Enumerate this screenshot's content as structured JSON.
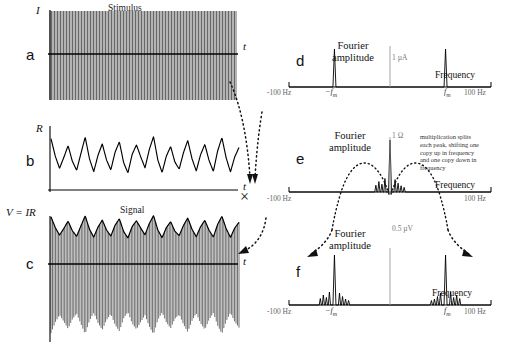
{
  "figure": {
    "caption_absent": true,
    "panels": [
      "a",
      "b",
      "c",
      "d",
      "e",
      "f"
    ]
  },
  "panel_a": {
    "label": "a",
    "title": "Stimulus",
    "y_axis": "I",
    "x_axis": "t",
    "description": "high-frequency carrier sinusoid, constant amplitude"
  },
  "panel_b": {
    "label": "b",
    "title": "",
    "y_axis": "R",
    "x_axis": "t",
    "description": "slowly varying irregular resistance waveform"
  },
  "panel_c": {
    "label": "c",
    "title": "Signal",
    "y_axis": "V = IR",
    "x_axis": "t",
    "description": "amplitude-modulated carrier, envelope follows R"
  },
  "panel_d": {
    "label": "d",
    "fourier_title_line1": "Fourier",
    "fourier_title_line2": "amplitude",
    "amplitude_tick": "1 µA",
    "x_label": "Frequency",
    "ticks": [
      "-100 Hz",
      "−f",
      "f",
      "100 Hz"
    ],
    "tick_left_full": "-100 Hz",
    "tick_right_full": "100 Hz",
    "tick_neg_fm": "−f",
    "tick_pos_fm": "f",
    "fm_sub": "m"
  },
  "panel_e": {
    "label": "e",
    "fourier_title_line1": "Fourier",
    "fourier_title_line2": "amplitude",
    "amplitude_tick": "1 Ω",
    "x_label": "Frequency",
    "tick_left_full": "-100 Hz",
    "tick_right_full": "100 Hz",
    "annotation": "multiplication splits each peak, shifting one copy up in frequency and one copy down in frequency"
  },
  "panel_f": {
    "label": "f",
    "fourier_title_line1": "Fourier",
    "fourier_title_line2": "amplitude",
    "amplitude_tick": "0.5 µV",
    "x_label": "Frequency",
    "tick_left_full": "-100 Hz",
    "tick_right_full": "100 Hz",
    "tick_neg_fm": "−f",
    "tick_pos_fm": "f",
    "fm_sub": "m"
  },
  "operator": {
    "multiply_symbol": "×"
  },
  "chart_data": {
    "type": "line",
    "panels": [
      {
        "id": "a",
        "type": "line",
        "title": "Stimulus",
        "xlabel": "t",
        "ylabel": "I",
        "description": "Sinusoidal carrier at f_m with constant amplitude",
        "carrier_cycles": 62,
        "amplitude": 1.0,
        "ylim": [
          -1.1,
          1.1
        ]
      },
      {
        "id": "b",
        "type": "line",
        "title": "",
        "xlabel": "t",
        "ylabel": "R",
        "description": "Low-frequency irregular modulation waveform",
        "ylim": [
          -1.0,
          1.0
        ],
        "samples": [
          0.82,
          0.15,
          -0.32,
          0.1,
          0.55,
          -0.05,
          -0.4,
          0.25,
          0.88,
          0.05,
          -0.45,
          0.18,
          0.62,
          0.0,
          -0.38,
          0.3,
          0.7,
          -0.1,
          -0.5,
          0.22,
          0.58,
          0.12,
          -0.3,
          0.4,
          0.9,
          0.0,
          -0.48,
          0.15,
          0.52,
          -0.08,
          -0.35,
          0.28,
          0.75,
          0.05,
          -0.42,
          0.2,
          0.6,
          -0.02,
          -0.44,
          0.35,
          0.86,
          0.08,
          -0.46,
          0.12,
          0.48
        ]
      },
      {
        "id": "c",
        "type": "line",
        "title": "Signal",
        "xlabel": "t",
        "ylabel": "V = IR",
        "description": "Product I x R: carrier amplitude-modulated by R envelope",
        "carrier_cycles": 62,
        "ylim": [
          -1.1,
          1.1
        ]
      },
      {
        "id": "d",
        "type": "line",
        "title": "Fourier amplitude",
        "xlabel": "Frequency",
        "ylabel": "Fourier amplitude",
        "xlim": [
          -100,
          100
        ],
        "xunit": "Hz",
        "yticklabel": "1 µA",
        "xticks": [
          -100,
          -55,
          55,
          100
        ],
        "xticklabels": [
          "-100 Hz",
          "-f_m",
          "f_m",
          "100 Hz"
        ],
        "peaks": [
          {
            "freq": -55,
            "amplitude": 1.0
          },
          {
            "freq": 55,
            "amplitude": 1.0
          }
        ],
        "description": "Two sharp delta peaks at plus and minus f_m"
      },
      {
        "id": "e",
        "type": "line",
        "title": "Fourier amplitude",
        "xlabel": "Frequency",
        "ylabel": "Fourier amplitude",
        "xlim": [
          -100,
          100
        ],
        "xunit": "Hz",
        "yticklabel": "1 Ω",
        "xticks": [
          -100,
          100
        ],
        "xticklabels": [
          "-100 Hz",
          "100 Hz"
        ],
        "peaks": [
          {
            "freq": 0,
            "amplitude": 1.0
          },
          {
            "freq": -14,
            "amplitude": 0.13
          },
          {
            "freq": -11,
            "amplitude": 0.2
          },
          {
            "freq": -8,
            "amplitude": 0.15
          },
          {
            "freq": -5,
            "amplitude": 0.26
          },
          {
            "freq": 5,
            "amplitude": 0.24
          },
          {
            "freq": 8,
            "amplitude": 0.17
          },
          {
            "freq": 11,
            "amplitude": 0.12
          },
          {
            "freq": 14,
            "amplitude": 0.09
          }
        ],
        "annotation": "multiplication splits each peak, shifting one copy up in frequency and one copy down in frequency",
        "description": "Baseband spectrum of R concentrated near zero frequency"
      },
      {
        "id": "f",
        "type": "line",
        "title": "Fourier amplitude",
        "xlabel": "Frequency",
        "ylabel": "Fourier amplitude",
        "xlim": [
          -100,
          100
        ],
        "xunit": "Hz",
        "yticklabel": "0.5 µV",
        "xticks": [
          -100,
          -55,
          55,
          100
        ],
        "xticklabels": [
          "-100 Hz",
          "-f_m",
          "f_m",
          "100 Hz"
        ],
        "peaks": [
          {
            "freq": -55,
            "amplitude": 1.0
          },
          {
            "freq": -69,
            "amplitude": 0.13
          },
          {
            "freq": -66,
            "amplitude": 0.2
          },
          {
            "freq": -63,
            "amplitude": 0.15
          },
          {
            "freq": -60,
            "amplitude": 0.26
          },
          {
            "freq": -50,
            "amplitude": 0.24
          },
          {
            "freq": -47,
            "amplitude": 0.17
          },
          {
            "freq": -44,
            "amplitude": 0.12
          },
          {
            "freq": -41,
            "amplitude": 0.09
          },
          {
            "freq": 55,
            "amplitude": 1.0
          },
          {
            "freq": 41,
            "amplitude": 0.09
          },
          {
            "freq": 44,
            "amplitude": 0.12
          },
          {
            "freq": 47,
            "amplitude": 0.17
          },
          {
            "freq": 50,
            "amplitude": 0.24
          },
          {
            "freq": 60,
            "amplitude": 0.26
          },
          {
            "freq": 63,
            "amplitude": 0.15
          },
          {
            "freq": 66,
            "amplitude": 0.2
          },
          {
            "freq": 69,
            "amplitude": 0.13
          }
        ],
        "description": "Carrier peaks at plus and minus f_m flanked by modulation sidebands"
      }
    ]
  }
}
